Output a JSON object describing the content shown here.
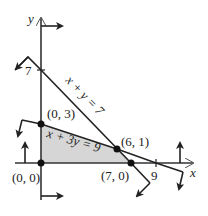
{
  "diagram": {
    "type": "linear-programming-feasible-region",
    "axes": {
      "x_label": "x",
      "y_label": "y",
      "x_tick_label": "9",
      "y_tick_label": "7"
    },
    "lines": [
      {
        "equation": "x + y = 7"
      },
      {
        "equation": "x + 3y = 9"
      }
    ],
    "vertices": [
      {
        "label": "(0, 0)"
      },
      {
        "label": "(0, 3)"
      },
      {
        "label": "(6, 1)"
      },
      {
        "label": "(7, 0)"
      }
    ],
    "colors": {
      "region_fill": "#d6d6d6",
      "line": "#222222",
      "point": "#111111"
    }
  }
}
